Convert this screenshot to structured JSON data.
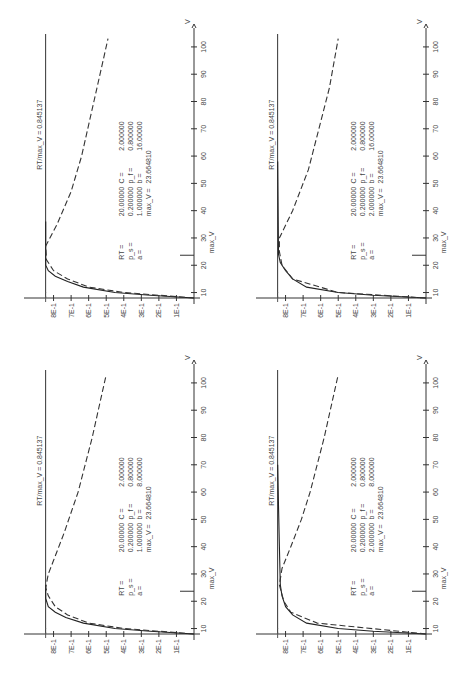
{
  "chart_data": [
    {
      "id": "top-left",
      "type": "line",
      "xlabel": "V",
      "x_ticks": [
        10,
        20,
        30,
        40,
        50,
        60,
        70,
        80,
        90,
        100
      ],
      "y_ticks": [
        "1E-1",
        "2E-1",
        "3E-1",
        "4E-1",
        "5E-1",
        "6E-1",
        "7E-1",
        "8E-1"
      ],
      "xlim": [
        8,
        104
      ],
      "ylim": [
        0,
        0.9
      ],
      "reference_line": {
        "label": "RT/max_V =",
        "value": "0.845137",
        "y": 0.845137
      },
      "marker": {
        "label": "max_V",
        "x": 23.66481
      },
      "params": [
        [
          "RT =",
          "20.00000",
          "C =",
          "2.000000"
        ],
        [
          "p_s =",
          "0.200000",
          "p_f =",
          "0.800000"
        ],
        [
          "a =",
          "1.000000",
          "b =",
          "16.00000"
        ],
        [
          "",
          "max_V =",
          "23.664810",
          ""
        ]
      ],
      "series": [
        {
          "name": "solid",
          "style": "solid",
          "x": [
            8,
            9,
            10,
            12,
            14,
            16,
            18,
            20,
            36
          ],
          "y": [
            0,
            0.25,
            0.45,
            0.63,
            0.72,
            0.79,
            0.83,
            0.845,
            0.845
          ]
        },
        {
          "name": "dashed",
          "style": "dashed",
          "x": [
            8,
            10,
            12,
            15,
            18,
            22,
            27,
            35,
            47,
            60,
            80,
            103
          ],
          "y": [
            0,
            0.4,
            0.6,
            0.72,
            0.8,
            0.84,
            0.845,
            0.78,
            0.7,
            0.64,
            0.57,
            0.49
          ]
        }
      ]
    },
    {
      "id": "top-right",
      "type": "line",
      "xlabel": "V",
      "x_ticks": [
        10,
        20,
        30,
        40,
        50,
        60,
        70,
        80,
        90,
        100
      ],
      "y_ticks": [
        "1E-1",
        "2E-1",
        "3E-1",
        "4E-1",
        "5E-1",
        "6E-1",
        "7E-1",
        "8E-1"
      ],
      "xlim": [
        8,
        104
      ],
      "ylim": [
        0,
        0.9
      ],
      "reference_line": {
        "label": "RT/max_V =",
        "value": "0.845137",
        "y": 0.845137
      },
      "marker": {
        "label": "max_V",
        "x": 23.66481
      },
      "params": [
        [
          "RT =",
          "20.00000",
          "C =",
          "2.000000"
        ],
        [
          "p_s =",
          "0.200000",
          "p_f =",
          "0.800000"
        ],
        [
          "a =",
          "2.000000",
          "b =",
          "16.00000"
        ],
        [
          "",
          "max_V =",
          "23.664810",
          ""
        ]
      ],
      "series": [
        {
          "name": "solid",
          "style": "solid",
          "x": [
            8,
            9,
            10,
            12,
            15,
            18,
            21,
            24,
            58
          ],
          "y": [
            0,
            0.3,
            0.5,
            0.68,
            0.76,
            0.8,
            0.83,
            0.84,
            0.845
          ]
        },
        {
          "name": "dashed",
          "style": "dashed",
          "x": [
            8,
            10,
            15,
            20,
            25,
            30,
            40,
            55,
            70,
            85,
            103
          ],
          "y": [
            0,
            0.5,
            0.76,
            0.82,
            0.835,
            0.835,
            0.76,
            0.67,
            0.61,
            0.55,
            0.5
          ]
        }
      ]
    },
    {
      "id": "bottom-left",
      "type": "line",
      "xlabel": "V",
      "x_ticks": [
        10,
        20,
        30,
        40,
        50,
        60,
        70,
        80,
        90,
        100
      ],
      "y_ticks": [
        "1E-1",
        "2E-1",
        "3E-1",
        "4E-1",
        "5E-1",
        "6E-1",
        "7E-1",
        "8E-1"
      ],
      "xlim": [
        8,
        104
      ],
      "ylim": [
        0,
        0.9
      ],
      "reference_line": {
        "label": "RT/max_V =",
        "value": "0.845137",
        "y": 0.845137
      },
      "marker": {
        "label": "max_V",
        "x": 23.66481
      },
      "params": [
        [
          "RT =",
          "20.00000",
          "C =",
          "2.000000"
        ],
        [
          "p_s =",
          "0.200000",
          "p_f =",
          "0.800000"
        ],
        [
          "a =",
          "1.000000",
          "b =",
          "8.000000"
        ],
        [
          "",
          "max_V =",
          "23.664810",
          ""
        ]
      ],
      "series": [
        {
          "name": "solid",
          "style": "solid",
          "x": [
            8,
            9,
            10,
            12,
            14,
            16,
            18,
            21,
            26
          ],
          "y": [
            0,
            0.25,
            0.45,
            0.63,
            0.73,
            0.79,
            0.83,
            0.845,
            0.845
          ]
        },
        {
          "name": "dashed",
          "style": "dashed",
          "x": [
            8,
            10,
            12,
            15,
            18,
            22,
            25,
            30,
            35,
            45,
            60,
            80,
            103
          ],
          "y": [
            0,
            0.4,
            0.6,
            0.72,
            0.79,
            0.83,
            0.845,
            0.83,
            0.8,
            0.74,
            0.66,
            0.58,
            0.5
          ]
        }
      ]
    },
    {
      "id": "bottom-right",
      "type": "line",
      "xlabel": "V",
      "x_ticks": [
        10,
        20,
        30,
        40,
        50,
        60,
        70,
        80,
        90,
        100
      ],
      "y_ticks": [
        "1E-1",
        "2E-1",
        "3E-1",
        "4E-1",
        "5E-1",
        "6E-1",
        "7E-1",
        "8E-1"
      ],
      "xlim": [
        8,
        104
      ],
      "ylim": [
        0,
        0.9
      ],
      "reference_line": {
        "label": "RT/max_V =",
        "value": "0.845137",
        "y": 0.845137
      },
      "marker": {
        "label": "max_V",
        "x": 23.66481
      },
      "params": [
        [
          "RT =",
          "20.00000",
          "C =",
          "2.000000"
        ],
        [
          "p_s =",
          "0.200000",
          "p_f =",
          "0.800000"
        ],
        [
          "a =",
          "2.000000",
          "b =",
          "8.000000"
        ],
        [
          "",
          "max_V =",
          "23.664810",
          ""
        ]
      ],
      "series": [
        {
          "name": "solid",
          "style": "solid",
          "x": [
            8,
            9,
            10,
            12,
            15,
            18,
            22,
            26,
            40,
            55,
            70
          ],
          "y": [
            0,
            0.3,
            0.5,
            0.68,
            0.76,
            0.8,
            0.82,
            0.83,
            0.835,
            0.84,
            0.845
          ]
        },
        {
          "name": "dashed",
          "style": "dashed",
          "x": [
            8,
            12,
            16,
            20,
            26,
            32,
            40,
            50,
            60,
            80,
            103
          ],
          "y": [
            0,
            0.62,
            0.77,
            0.81,
            0.835,
            0.82,
            0.77,
            0.71,
            0.66,
            0.58,
            0.5
          ]
        }
      ]
    }
  ]
}
